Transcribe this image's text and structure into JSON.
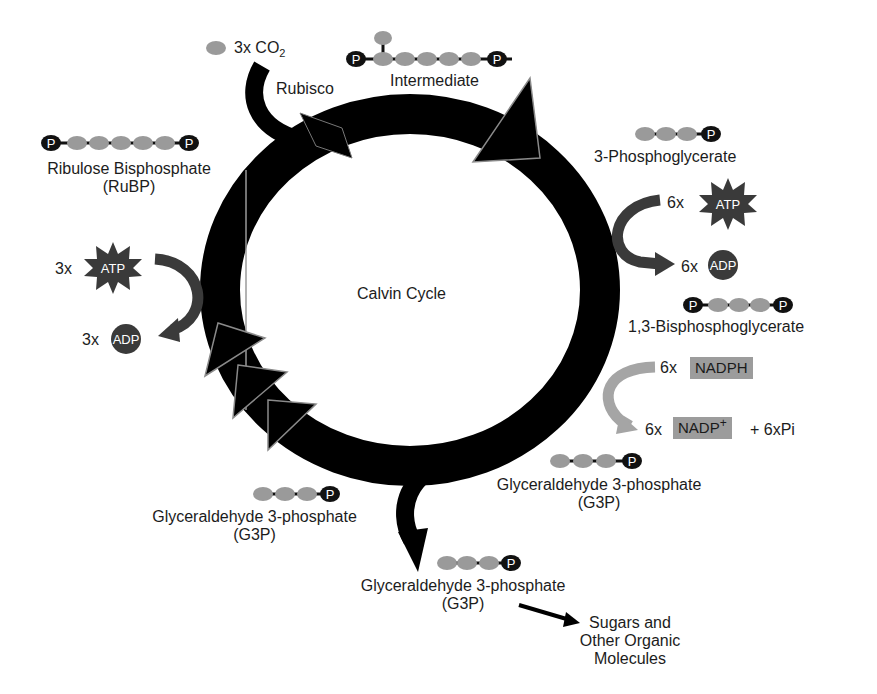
{
  "diagram": {
    "title": "Calvin Cycle",
    "colors": {
      "ring": "#000000",
      "carbon": "#9a9a9a",
      "phosphate": "#111111",
      "energy_arrow": "#3a3a3a",
      "nadph_arrow": "#a5a5a5",
      "nadph_box": "#9c9c9c",
      "text": "#1c1c1c"
    },
    "inputs": {
      "co2": {
        "count": "3x",
        "label": "CO",
        "subscript": "2",
        "enzyme": "Rubisco"
      }
    },
    "molecules": {
      "intermediate": {
        "label": "Intermediate",
        "carbons": 6,
        "phosphates": 2,
        "branch": true
      },
      "pga": {
        "label": "3-Phosphoglycerate",
        "carbons": 3,
        "phosphates": 1
      },
      "bpg": {
        "label": "1,3-Bisphosphoglycerate",
        "carbons": 3,
        "phosphates": 2
      },
      "g3p_right": {
        "label": "Glyceraldehyde 3-phosphate",
        "abbr": "(G3P)",
        "carbons": 3,
        "phosphates": 1
      },
      "g3p_left": {
        "label": "Glyceraldehyde 3-phosphate",
        "abbr": "(G3P)",
        "carbons": 3,
        "phosphates": 1
      },
      "g3p_out": {
        "label": "Glyceraldehyde 3-phosphate",
        "abbr": "(G3P)",
        "carbons": 3,
        "phosphates": 1
      },
      "rubp": {
        "label": "Ribulose Bisphosphate",
        "abbr": "(RuBP)",
        "carbons": 5,
        "phosphates": 2
      }
    },
    "energy": {
      "atp_right": {
        "count": "6x",
        "label": "ATP"
      },
      "adp_right": {
        "count": "6x",
        "label": "ADP"
      },
      "atp_left": {
        "count": "3x",
        "label": "ATP"
      },
      "adp_left": {
        "count": "3x",
        "label": "ADP"
      },
      "nadph": {
        "count": "6x",
        "label": "NADPH"
      },
      "nadp": {
        "count": "6x",
        "label": "NADP",
        "superscript": "+",
        "extra": "+ 6xPi"
      }
    },
    "output": {
      "products": [
        "Sugars and",
        "Other Organic",
        "Molecules"
      ]
    },
    "phosphate_symbol": "P"
  }
}
